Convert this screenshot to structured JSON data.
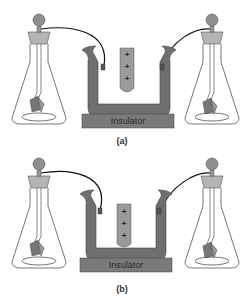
{
  "panels": [
    {
      "id": "a",
      "caption": "(a)",
      "insulator_label": "Insulator",
      "rod_charges": [
        "+",
        "+",
        "+"
      ],
      "rod_position": "raised"
    },
    {
      "id": "b",
      "caption": "(b)",
      "insulator_label": "Insulator",
      "rod_charges": [
        "+",
        "+",
        "+"
      ],
      "rod_position": "lowered"
    }
  ],
  "colors": {
    "container": "#6f6f6f",
    "insulator": "#7a7a7a",
    "rod": "#9a9a9a",
    "cork": "#b5b5b5",
    "knob": "#8f8f8f",
    "wire": "#111111",
    "glass": "#555555"
  }
}
